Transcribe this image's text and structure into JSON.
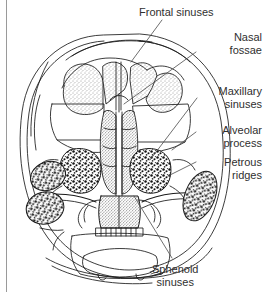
{
  "figure": {
    "type": "anatomical-line-drawing",
    "background_color": "#ffffff",
    "ink_color": "#1a1a1a",
    "text_color": "#2f2f2f",
    "border_color": "#9a9a9a"
  },
  "labels": [
    {
      "id": "frontal-sinuses",
      "line1": "Frontal sinuses",
      "line2": ""
    },
    {
      "id": "nasal-fossae",
      "line1": "Nasal",
      "line2": "fossae"
    },
    {
      "id": "maxillary-sinuses",
      "line1": "Maxillary",
      "line2": "sinuses"
    },
    {
      "id": "alveolar-process",
      "line1": "Alveolar",
      "line2": "process"
    },
    {
      "id": "petrous-ridges",
      "line1": "Petrous",
      "line2": "ridges"
    },
    {
      "id": "sphenoid-sinuses",
      "line1": "Sphenoid",
      "line2": "sinuses"
    }
  ]
}
